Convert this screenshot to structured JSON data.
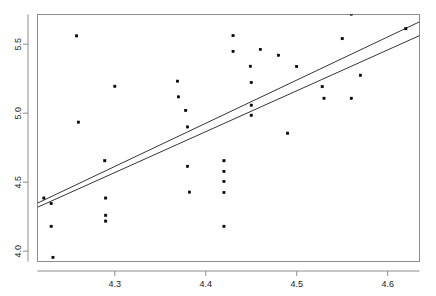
{
  "chart_data": {
    "type": "scatter",
    "title": "",
    "subtitle": "",
    "xlabel": "",
    "ylabel": "",
    "xlim": [
      4.215,
      4.635
    ],
    "ylim": [
      3.925,
      5.715
    ],
    "xticks": [
      4.3,
      4.4,
      4.5,
      4.6
    ],
    "xtick_labels": [
      "4.3",
      "4.4",
      "4.5",
      "4.6"
    ],
    "yticks": [
      4.0,
      4.5,
      5.0,
      5.5
    ],
    "ytick_labels": [
      "4.0",
      "4.5",
      "5.0",
      "5.5"
    ],
    "grid": false,
    "legend": null,
    "box": true,
    "point_color": "#000000",
    "point_size": 2.2,
    "line_color": "#000000",
    "points": [
      {
        "x": 4.222,
        "y": 4.385
      },
      {
        "x": 4.23,
        "y": 4.345
      },
      {
        "x": 4.23,
        "y": 4.18
      },
      {
        "x": 4.232,
        "y": 3.955
      },
      {
        "x": 4.258,
        "y": 5.56
      },
      {
        "x": 4.26,
        "y": 4.935
      },
      {
        "x": 4.289,
        "y": 4.655
      },
      {
        "x": 4.29,
        "y": 4.385
      },
      {
        "x": 4.29,
        "y": 4.26
      },
      {
        "x": 4.29,
        "y": 4.218
      },
      {
        "x": 4.3,
        "y": 5.195
      },
      {
        "x": 4.369,
        "y": 5.232
      },
      {
        "x": 4.37,
        "y": 5.118
      },
      {
        "x": 4.378,
        "y": 5.02
      },
      {
        "x": 4.38,
        "y": 4.9
      },
      {
        "x": 4.38,
        "y": 4.615
      },
      {
        "x": 4.382,
        "y": 4.428
      },
      {
        "x": 4.42,
        "y": 4.655
      },
      {
        "x": 4.42,
        "y": 4.578
      },
      {
        "x": 4.42,
        "y": 4.505
      },
      {
        "x": 4.42,
        "y": 4.425
      },
      {
        "x": 4.42,
        "y": 4.18
      },
      {
        "x": 4.43,
        "y": 5.562
      },
      {
        "x": 4.43,
        "y": 5.448
      },
      {
        "x": 4.449,
        "y": 5.34
      },
      {
        "x": 4.45,
        "y": 5.222
      },
      {
        "x": 4.45,
        "y": 5.058
      },
      {
        "x": 4.45,
        "y": 4.985
      },
      {
        "x": 4.46,
        "y": 5.462
      },
      {
        "x": 4.48,
        "y": 5.42
      },
      {
        "x": 4.49,
        "y": 4.855
      },
      {
        "x": 4.5,
        "y": 5.338
      },
      {
        "x": 4.528,
        "y": 5.192
      },
      {
        "x": 4.53,
        "y": 5.108
      },
      {
        "x": 4.55,
        "y": 5.54
      },
      {
        "x": 4.56,
        "y": 5.718
      },
      {
        "x": 4.56,
        "y": 5.108
      },
      {
        "x": 4.57,
        "y": 5.275
      },
      {
        "x": 4.62,
        "y": 5.612
      }
    ],
    "lines": [
      {
        "name": "fit-line-upper",
        "x0": 4.215,
        "y0": 4.348,
        "x1": 4.635,
        "y1": 5.662
      },
      {
        "name": "fit-line-lower",
        "x0": 4.215,
        "y0": 4.318,
        "x1": 4.635,
        "y1": 5.562
      }
    ]
  }
}
